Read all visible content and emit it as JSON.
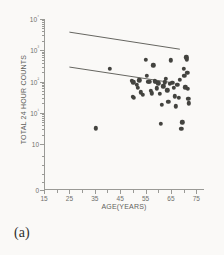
{
  "figure": {
    "caption": "(a)",
    "background_color": "#faf9f7",
    "marker_color": "#43433f",
    "axis_color": "#9a9a96"
  },
  "chart_data": {
    "type": "scatter",
    "title": "",
    "xlabel": "AGE(YEARS)",
    "ylabel": "TOTAL 24 HOUR COUNTS",
    "xlim": [
      15,
      78
    ],
    "ylim_log": [
      0,
      4
    ],
    "yscale": "log",
    "xscale": "linear",
    "grid": false,
    "legend": null,
    "xticks": [
      15,
      25,
      35,
      45,
      55,
      65,
      75
    ],
    "xtick_labels": [
      "15",
      "25",
      "35",
      "45",
      "55",
      "65",
      "75"
    ],
    "ytick_labels": [
      "10⁴",
      "10³",
      "10²",
      "10¹",
      "10",
      "0"
    ],
    "ytick_values": [
      10000,
      1000,
      100,
      10,
      1,
      0
    ],
    "points": [
      {
        "x": 35.5,
        "y": 3.2
      },
      {
        "x": 41.0,
        "y": 255
      },
      {
        "x": 49.5,
        "y": 105
      },
      {
        "x": 50.2,
        "y": 95
      },
      {
        "x": 50.0,
        "y": 33
      },
      {
        "x": 50.4,
        "y": 30
      },
      {
        "x": 51.5,
        "y": 80
      },
      {
        "x": 52.0,
        "y": 62
      },
      {
        "x": 52.6,
        "y": 110
      },
      {
        "x": 53.0,
        "y": 45
      },
      {
        "x": 54.0,
        "y": 37
      },
      {
        "x": 55.0,
        "y": 500
      },
      {
        "x": 55.5,
        "y": 155
      },
      {
        "x": 56.0,
        "y": 98
      },
      {
        "x": 56.5,
        "y": 100
      },
      {
        "x": 57.0,
        "y": 50
      },
      {
        "x": 57.5,
        "y": 42
      },
      {
        "x": 58.0,
        "y": 330
      },
      {
        "x": 58.6,
        "y": 102
      },
      {
        "x": 59.0,
        "y": 96
      },
      {
        "x": 59.5,
        "y": 60
      },
      {
        "x": 60.0,
        "y": 88
      },
      {
        "x": 60.5,
        "y": 40
      },
      {
        "x": 61.0,
        "y": 4.5
      },
      {
        "x": 61.5,
        "y": 18
      },
      {
        "x": 62.0,
        "y": 70
      },
      {
        "x": 62.5,
        "y": 94
      },
      {
        "x": 63.0,
        "y": 120
      },
      {
        "x": 63.5,
        "y": 52
      },
      {
        "x": 64.0,
        "y": 22
      },
      {
        "x": 64.5,
        "y": 86
      },
      {
        "x": 65.0,
        "y": 480
      },
      {
        "x": 65.5,
        "y": 90
      },
      {
        "x": 66.0,
        "y": 62
      },
      {
        "x": 66.5,
        "y": 34
      },
      {
        "x": 67.0,
        "y": 16
      },
      {
        "x": 67.5,
        "y": 78
      },
      {
        "x": 68.0,
        "y": 30
      },
      {
        "x": 68.5,
        "y": 115
      },
      {
        "x": 69.0,
        "y": 3.0
      },
      {
        "x": 69.5,
        "y": 5.0
      },
      {
        "x": 70.0,
        "y": 250
      },
      {
        "x": 70.3,
        "y": 150
      },
      {
        "x": 70.6,
        "y": 65
      },
      {
        "x": 71.0,
        "y": 600
      },
      {
        "x": 71.2,
        "y": 520
      },
      {
        "x": 71.4,
        "y": 190
      },
      {
        "x": 71.6,
        "y": 58
      },
      {
        "x": 71.8,
        "y": 28
      },
      {
        "x": 72.0,
        "y": 20
      }
    ],
    "lines": [
      {
        "name": "upper-boundary-line",
        "x_start": 25.0,
        "y_start": 3800,
        "x_end": 68.5,
        "y_end": 1080
      },
      {
        "name": "lower-boundary-line",
        "x_start": 25.0,
        "y_start": 290,
        "x_end": 65.0,
        "y_end": 93
      }
    ]
  }
}
